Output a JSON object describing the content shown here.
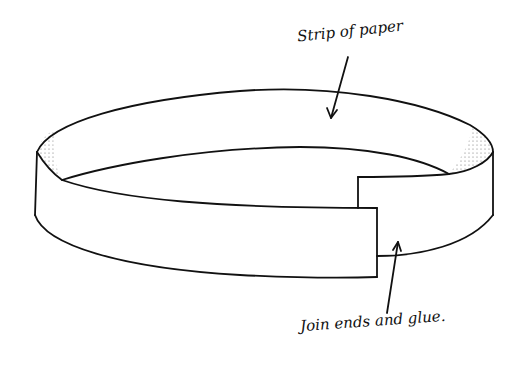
{
  "diagram": {
    "labels": {
      "strip": "Strip of paper",
      "join": "Join ends and glue."
    },
    "colors": {
      "stroke": "#111111",
      "background": "#ffffff",
      "stipple": "#555555"
    }
  }
}
